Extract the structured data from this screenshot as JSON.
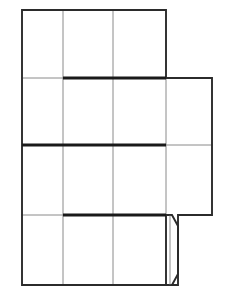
{
  "document": {
    "title": "Box Net Line Drawing",
    "kind": "packaging-die-cut-net",
    "background_color": "#ffffff",
    "canvas": {
      "width": 231,
      "height": 305
    }
  },
  "styles": {
    "cut_line_color": "#2b2b2b",
    "cut_line_width": 1.9,
    "inner_line_color": "#8a8a8a",
    "inner_line_width": 1.0,
    "score_line_color": "#1a1a1a",
    "score_line_width": 3.2,
    "face_fill": "#ffffff"
  },
  "geometry": {
    "columns_x": [
      22,
      63,
      113,
      166,
      212
    ],
    "rows_y": [
      10,
      78,
      145,
      215,
      285
    ],
    "flap": {
      "left_x": 166,
      "right_x": 178,
      "top_y": 215,
      "bottom_y": 285,
      "chamfer": 11
    }
  },
  "outline": {
    "name": "net-outline",
    "points": "22,10 166,10 166,78 212,78 212,215 178,215 178,285 22,285"
  },
  "panels": [
    {
      "id": "r1c1",
      "name": "top-row-left-panel",
      "x": 22,
      "y": 10,
      "w": 41,
      "h": 68
    },
    {
      "id": "r1c2",
      "name": "top-row-center-panel",
      "x": 63,
      "y": 10,
      "w": 50,
      "h": 68
    },
    {
      "id": "r1c3",
      "name": "top-row-right-panel",
      "x": 113,
      "y": 10,
      "w": 53,
      "h": 68
    },
    {
      "id": "r2c1",
      "name": "second-row-left-panel",
      "x": 22,
      "y": 78,
      "w": 41,
      "h": 67
    },
    {
      "id": "r2c2",
      "name": "second-row-center-panel",
      "x": 63,
      "y": 78,
      "w": 50,
      "h": 67
    },
    {
      "id": "r2c3",
      "name": "second-row-right-panel",
      "x": 113,
      "y": 78,
      "w": 53,
      "h": 67
    },
    {
      "id": "r2c4",
      "name": "second-row-side-flap",
      "x": 166,
      "y": 78,
      "w": 46,
      "h": 67
    },
    {
      "id": "r3c1",
      "name": "third-row-left-panel",
      "x": 22,
      "y": 145,
      "w": 41,
      "h": 70
    },
    {
      "id": "r3c2",
      "name": "third-row-center-panel",
      "x": 63,
      "y": 145,
      "w": 50,
      "h": 70
    },
    {
      "id": "r3c3",
      "name": "third-row-right-panel",
      "x": 113,
      "y": 145,
      "w": 53,
      "h": 70
    },
    {
      "id": "r3c4",
      "name": "third-row-side-flap",
      "x": 166,
      "y": 145,
      "w": 46,
      "h": 70
    },
    {
      "id": "r4c1",
      "name": "bottom-row-left-panel",
      "x": 22,
      "y": 215,
      "w": 41,
      "h": 70
    },
    {
      "id": "r4c2",
      "name": "bottom-row-center-panel",
      "x": 63,
      "y": 215,
      "w": 50,
      "h": 70
    },
    {
      "id": "r4c3",
      "name": "bottom-row-right-panel",
      "x": 113,
      "y": 215,
      "w": 53,
      "h": 70
    }
  ],
  "inner_lines": {
    "verticals": [
      {
        "name": "inner-vertical-column-1",
        "x": 63,
        "y1": 10,
        "y2": 285
      },
      {
        "name": "inner-vertical-column-2",
        "x": 113,
        "y1": 10,
        "y2": 285
      },
      {
        "name": "inner-vertical-column-3",
        "x": 166,
        "y1": 78,
        "y2": 215
      }
    ],
    "horizontals": [
      {
        "name": "inner-horizontal-row-1",
        "x1": 22,
        "x2": 166,
        "y": 78
      },
      {
        "name": "inner-horizontal-row-1-right",
        "x1": 166,
        "x2": 212,
        "y": 78
      },
      {
        "name": "inner-horizontal-row-2",
        "x1": 22,
        "x2": 212,
        "y": 145
      },
      {
        "name": "inner-horizontal-row-3",
        "x1": 22,
        "x2": 166,
        "y": 215
      }
    ]
  },
  "score_lines": [
    {
      "name": "score-line-upper",
      "x1": 63,
      "x2": 166,
      "y": 78,
      "label": "fold crease upper"
    },
    {
      "name": "score-line-middle",
      "x1": 22,
      "x2": 166,
      "y": 145,
      "label": "fold crease middle"
    },
    {
      "name": "score-line-lower",
      "x1": 63,
      "x2": 166,
      "y": 215,
      "label": "fold crease lower"
    }
  ],
  "flap_shape": {
    "name": "tuck-flap",
    "outer_points": "166,215 172,215 178,226 178,274 172,285 166,285",
    "inner_edge": {
      "x": 170,
      "y1": 216,
      "y2": 284
    }
  }
}
